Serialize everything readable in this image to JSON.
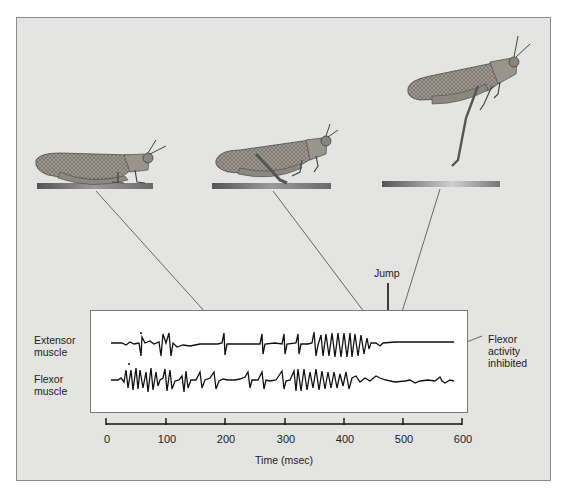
{
  "figure": {
    "stages": [
      {
        "name": "crouched",
        "description": "Grasshopper resting, legs folded"
      },
      {
        "name": "cocked",
        "description": "Grasshopper with hind legs cocked for jump"
      },
      {
        "name": "airborne",
        "description": "Grasshopper leaping off the platform"
      }
    ],
    "annotations": {
      "jump": "Jump",
      "flexor_inhibited": [
        "Flexor",
        "activity",
        "inhibited"
      ]
    },
    "trace_labels": {
      "extensor": [
        "Extensor",
        "muscle"
      ],
      "flexor": [
        "Flexor",
        "muscle"
      ]
    },
    "axis": {
      "title": "Time (msec)",
      "ticks": [
        "0",
        "100",
        "200",
        "300",
        "400",
        "500",
        "600"
      ]
    },
    "colors": {
      "panel": "#e4e4e2",
      "trace_box": "#ffffff",
      "ink": "#111111"
    }
  }
}
